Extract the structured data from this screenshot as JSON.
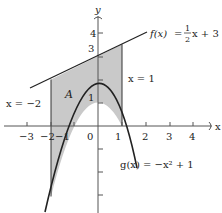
{
  "figure": {
    "x_axis_label": "x",
    "y_axis_label": "y",
    "x_tick_labels": [
      "−3",
      "−2",
      "−1",
      "0",
      "1",
      "2",
      "3",
      "4"
    ],
    "x_tick_values": [
      -3,
      -2,
      -1,
      0,
      1,
      2,
      3,
      4
    ],
    "y_tick_labels": [
      "1",
      "3",
      "4"
    ],
    "y_tick_values": [
      1,
      2,
      3,
      4,
      -1,
      -2,
      -3
    ],
    "region_label": "A",
    "f_label": {
      "name": "f(x)",
      "equals": "=",
      "frac_num": "1",
      "frac_den": "2",
      "rest": "x + 3"
    },
    "g_label": {
      "text": "g(x) = −x² + 1"
    },
    "left_bound_label": "x = −2",
    "right_bound_label": "x = 1",
    "colors": {
      "shade": "#c9c9c9",
      "line": "#222222",
      "axis": "#555555"
    }
  }
}
